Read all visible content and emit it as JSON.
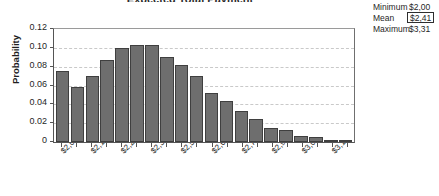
{
  "chart_data": {
    "type": "bar",
    "title": "Expected Total Payment",
    "xlabel": "",
    "ylabel": "Probability",
    "ylim": [
      0,
      0.12
    ],
    "yticks": [
      "0.12",
      "0.10",
      "0.08",
      "0.06",
      "0.04",
      "0.02",
      "0"
    ],
    "ytick_values": [
      0.12,
      0.1,
      0.08,
      0.06,
      0.04,
      0.02,
      0
    ],
    "grid": true,
    "legend": "none",
    "categories": [
      "$2,000",
      "$2,066",
      "$2,132",
      "$2,198",
      "$2,263",
      "$2,329",
      "$2,395",
      "$2,461",
      "$2,526",
      "$2,592",
      "$2,658",
      "$2,724",
      "$2,790",
      "$2,856",
      "$2,921",
      "$2,987",
      "$3,053",
      "$3,119",
      "$3,185",
      "$3,251"
    ],
    "xtick_labels": [
      "$2,000",
      "$2,132",
      "$2,263",
      "$2,395",
      "$2,526",
      "$2,658",
      "$2,790",
      "$2,921",
      "$3,053",
      "$3,185"
    ],
    "values": [
      0.075,
      0.058,
      0.07,
      0.087,
      0.1,
      0.103,
      0.103,
      0.09,
      0.082,
      0.07,
      0.052,
      0.044,
      0.033,
      0.024,
      0.015,
      0.013,
      0.006,
      0.005,
      0.002,
      0.002
    ]
  },
  "stats": {
    "rows": [
      {
        "label": "Minimum",
        "value": "$2,00",
        "boxed": false
      },
      {
        "label": "Mean",
        "value": "$2,41",
        "boxed": true
      },
      {
        "label": "Maximum",
        "value": "$3,31",
        "boxed": false
      }
    ]
  }
}
